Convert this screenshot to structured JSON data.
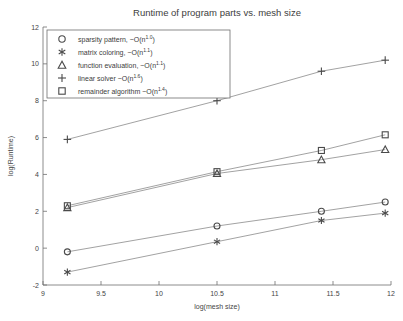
{
  "chart_data": {
    "type": "line",
    "title": "Runtime of program parts vs. mesh size",
    "xlabel": "log(mesh size)",
    "ylabel": "log(Runtime)",
    "xlim": [
      9,
      12
    ],
    "ylim": [
      -2,
      12
    ],
    "xticks": [
      9,
      9.5,
      10,
      10.5,
      11,
      11.5,
      12
    ],
    "xticklabels": [
      "9",
      "9.5",
      "10",
      "10.5",
      "11",
      "11.5",
      "12"
    ],
    "yticks": [
      -2,
      0,
      2,
      4,
      6,
      8,
      10,
      12
    ],
    "yticklabels": [
      "-2",
      "0",
      "2",
      "4",
      "6",
      "8",
      "10",
      "12"
    ],
    "grid": false,
    "legend_position": "upper left",
    "x": [
      9.21,
      10.5,
      11.4,
      11.95
    ],
    "series": [
      {
        "name": "sparsity pattern, ~O(n^1.0)",
        "label_text": "sparsity pattern, ~O(n",
        "exponent": "1.0",
        "label_tail": ")",
        "marker": "circle",
        "values": [
          -0.2,
          1.2,
          2.0,
          2.5
        ]
      },
      {
        "name": "matrix coloring, ~O(n^1.1)",
        "label_text": "matrix coloring, ~O(n",
        "exponent": "1.1",
        "label_tail": ")",
        "marker": "asterisk",
        "values": [
          -1.3,
          0.35,
          1.5,
          1.9
        ]
      },
      {
        "name": "function evaluation, ~O(n^1.1)",
        "label_text": "function evaluation, ~O(n",
        "exponent": "1.1",
        "label_tail": ")",
        "marker": "triangle",
        "values": [
          2.2,
          4.05,
          4.8,
          5.35
        ]
      },
      {
        "name": "linear solver ~O(n^1.6)",
        "label_text": "linear solver ~O(n",
        "exponent": "1.6",
        "label_tail": ")",
        "marker": "plus",
        "values": [
          5.9,
          8.0,
          9.6,
          10.2
        ]
      },
      {
        "name": "remainder algorithm ~O(n^1.4)",
        "label_text": "remainder algorithm ~O(n",
        "exponent": "1.4",
        "label_tail": ")",
        "marker": "square",
        "values": [
          2.3,
          4.15,
          5.3,
          6.15
        ]
      }
    ],
    "colors": {
      "line": "#8a8a8a",
      "marker": "#4a4a4a",
      "axis": "#6e6e6e",
      "text": "#3d3d3d",
      "background": "#ffffff"
    }
  }
}
